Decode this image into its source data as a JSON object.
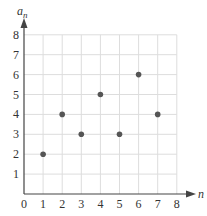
{
  "chart_data": {
    "type": "scatter",
    "title": "",
    "xlabel": "n",
    "ylabel": "a_n",
    "xlim": [
      0,
      8
    ],
    "ylim": [
      0,
      8
    ],
    "xticks": [
      0,
      1,
      2,
      3,
      4,
      5,
      6,
      7,
      8
    ],
    "yticks": [
      1,
      2,
      3,
      4,
      5,
      6,
      7,
      8
    ],
    "grid": true,
    "series": [
      {
        "name": "a_n",
        "x": [
          1,
          2,
          3,
          4,
          5,
          6,
          7
        ],
        "y": [
          2,
          4,
          3,
          5,
          3,
          6,
          4
        ]
      }
    ]
  },
  "labels": {
    "x": "n",
    "y_base": "a",
    "y_sub": "n"
  },
  "colors": {
    "point": "#555555",
    "grid": "#dddddd",
    "axis": "#444444"
  }
}
